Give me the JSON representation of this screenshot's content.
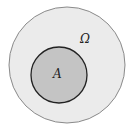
{
  "diagram": {
    "type": "venn",
    "universe": {
      "label": "Ω",
      "fill": "#ebebeb",
      "stroke": "#888888",
      "cx": 67,
      "cy": 65,
      "r": 58
    },
    "subset": {
      "label": "A",
      "fill": "#c4c4c4",
      "stroke": "#222222",
      "cx": 59,
      "cy": 75,
      "r": 28
    }
  }
}
